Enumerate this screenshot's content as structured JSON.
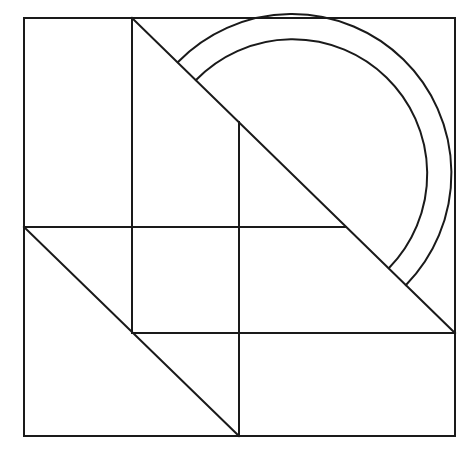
{
  "diagram": {
    "title": "",
    "stroke_color": "#1a1a1a",
    "background": "#ffffff",
    "outer_square": {
      "x1": 24,
      "y1": 18,
      "x2": 455,
      "y2": 436
    },
    "lines": [
      {
        "name": "vertical-left",
        "x1": 132,
        "y1": 18,
        "x2": 132,
        "y2": 333
      },
      {
        "name": "vertical-center",
        "x1": 239,
        "y1": 122,
        "x2": 239,
        "y2": 436
      },
      {
        "name": "horizontal-middle",
        "x1": 24,
        "y1": 227,
        "x2": 346,
        "y2": 227
      },
      {
        "name": "horizontal-lower",
        "x1": 132,
        "y1": 333,
        "x2": 455,
        "y2": 333
      },
      {
        "name": "diagonal-upper",
        "x1": 132,
        "y1": 18,
        "x2": 455,
        "y2": 333
      },
      {
        "name": "diagonal-lower",
        "x1": 24,
        "y1": 227,
        "x2": 239,
        "y2": 436
      }
    ],
    "arcs": [
      {
        "name": "arc-outer",
        "cx": 292,
        "cy": 174,
        "r": 142,
        "start": [
          178,
          62
        ],
        "end": [
          406,
          285
        ]
      },
      {
        "name": "arc-inner",
        "cx": 292,
        "cy": 174,
        "r": 118,
        "start": [
          196,
          80
        ],
        "end": [
          389,
          268
        ]
      }
    ]
  }
}
